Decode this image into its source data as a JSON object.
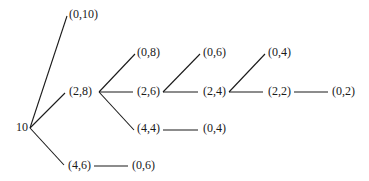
{
  "diagram": {
    "type": "game-tree",
    "root": {
      "label": "10",
      "x": 16,
      "y": 121
    },
    "nodes": [
      {
        "id": "n_0_10",
        "label": "(0,10)",
        "x": 69,
        "y": 8
      },
      {
        "id": "n_2_8",
        "label": "(2,8)",
        "x": 69,
        "y": 85
      },
      {
        "id": "n_4_6",
        "label": "(4,6)",
        "x": 68,
        "y": 159
      },
      {
        "id": "n_0_6a",
        "label": "(0,6)",
        "x": 132,
        "y": 159
      },
      {
        "id": "n_0_8",
        "label": "(0,8)",
        "x": 137,
        "y": 46
      },
      {
        "id": "n_2_6",
        "label": "(2,6)",
        "x": 137,
        "y": 85
      },
      {
        "id": "n_4_4",
        "label": "(4,4)",
        "x": 137,
        "y": 122
      },
      {
        "id": "n_0_4a",
        "label": "(0,4)",
        "x": 203,
        "y": 122
      },
      {
        "id": "n_0_6b",
        "label": "(0,6)",
        "x": 203,
        "y": 46
      },
      {
        "id": "n_2_4",
        "label": "(2,4)",
        "x": 203,
        "y": 85
      },
      {
        "id": "n_0_4b",
        "label": "(0,4)",
        "x": 268,
        "y": 46
      },
      {
        "id": "n_2_2",
        "label": "(2,2)",
        "x": 268,
        "y": 85
      },
      {
        "id": "n_0_2",
        "label": "(0,2)",
        "x": 332,
        "y": 85
      }
    ],
    "edges": [
      {
        "from": "root",
        "to": "n_0_10",
        "x1": 30,
        "y1": 128,
        "x2": 67,
        "y2": 16
      },
      {
        "from": "root",
        "to": "n_2_8",
        "x1": 30,
        "y1": 128,
        "x2": 65,
        "y2": 93
      },
      {
        "from": "root",
        "to": "n_4_6",
        "x1": 30,
        "y1": 128,
        "x2": 64,
        "y2": 165
      },
      {
        "from": "n_4_6",
        "to": "n_0_6a",
        "x1": 94,
        "y1": 166,
        "x2": 128,
        "y2": 166
      },
      {
        "from": "n_2_8",
        "to": "n_0_8",
        "x1": 99,
        "y1": 92,
        "x2": 135,
        "y2": 54
      },
      {
        "from": "n_2_8",
        "to": "n_2_6",
        "x1": 99,
        "y1": 92,
        "x2": 133,
        "y2": 92
      },
      {
        "from": "n_2_8",
        "to": "n_4_4",
        "x1": 99,
        "y1": 92,
        "x2": 134,
        "y2": 130
      },
      {
        "from": "n_4_4",
        "to": "n_0_4a",
        "x1": 163,
        "y1": 130,
        "x2": 198,
        "y2": 130
      },
      {
        "from": "n_2_6",
        "to": "n_0_6b",
        "x1": 163,
        "y1": 92,
        "x2": 200,
        "y2": 54
      },
      {
        "from": "n_2_6",
        "to": "n_2_4",
        "x1": 163,
        "y1": 92,
        "x2": 198,
        "y2": 92
      },
      {
        "from": "n_2_4",
        "to": "n_0_4b",
        "x1": 229,
        "y1": 92,
        "x2": 265,
        "y2": 54
      },
      {
        "from": "n_2_4",
        "to": "n_2_2",
        "x1": 229,
        "y1": 92,
        "x2": 263,
        "y2": 92
      },
      {
        "from": "n_2_2",
        "to": "n_0_2",
        "x1": 294,
        "y1": 92,
        "x2": 328,
        "y2": 92
      }
    ],
    "colors": {
      "line": "#1a1a1a",
      "text": "#1a1a1a",
      "background": "#ffffff"
    }
  }
}
